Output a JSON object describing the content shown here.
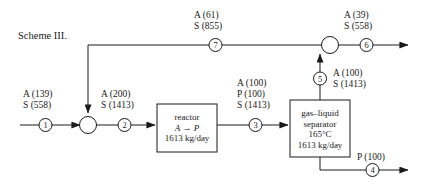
{
  "diagram": {
    "title": "Scheme III.",
    "units": [
      {
        "id": "reactor",
        "lines": [
          "reactor",
          "A → P",
          "1613 kg/day"
        ],
        "line1": "reactor",
        "line2": "A → P",
        "line3": "1613 kg/day"
      },
      {
        "id": "separator",
        "line1": "gas–liquid",
        "line2": "separator",
        "line3": "165°C",
        "line4": "1613 kg/day"
      }
    ],
    "streams": [
      {
        "number": "1",
        "label_lines": [
          "A (139)",
          "S (558)"
        ],
        "l1": "A (139)",
        "l2": "S (558)",
        "l3": ""
      },
      {
        "number": "2",
        "label_lines": [
          "A (200)",
          "S (1413)"
        ],
        "l1": "A (200)",
        "l2": "S (1413)",
        "l3": ""
      },
      {
        "number": "3",
        "label_lines": [
          "A (100)",
          "P (100)",
          "S (1413)"
        ],
        "l1": "A (100)",
        "l2": "P (100)",
        "l3": "S (1413)"
      },
      {
        "number": "4",
        "label_lines": [
          "P (100)"
        ],
        "l1": "P (100)",
        "l2": "",
        "l3": ""
      },
      {
        "number": "5",
        "label_lines": [
          "A (100)",
          "S (1413)"
        ],
        "l1": "A (100)",
        "l2": "S (1413)",
        "l3": ""
      },
      {
        "number": "6",
        "label_lines": [
          "A (39)",
          "S (558)"
        ],
        "l1": "A (39)",
        "l2": "S (558)",
        "l3": ""
      },
      {
        "number": "7",
        "label_lines": [
          "A (61)",
          "S (855)"
        ],
        "l1": "A (61)",
        "l2": "S (855)",
        "l3": ""
      }
    ],
    "junctions": [
      {
        "id": "mixer",
        "label": ""
      },
      {
        "id": "splitter",
        "label": ""
      }
    ],
    "colors": {
      "line": "#1a1a1a",
      "text": "#1a1a1a",
      "background": "#ffffff"
    }
  }
}
